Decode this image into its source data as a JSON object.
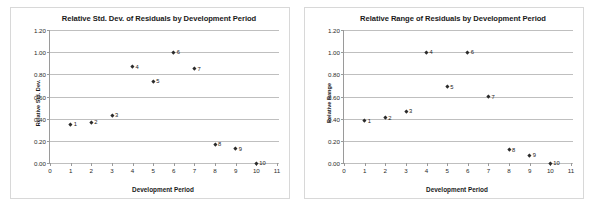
{
  "chart_data": [
    {
      "type": "scatter",
      "title": "Relative Std. Dev. of Residuals by Development Period",
      "xlabel": "Development Period",
      "ylabel": "Relative Std. Dev.",
      "xlim": [
        0,
        11
      ],
      "ylim": [
        0.0,
        1.2
      ],
      "xticks": [
        "0",
        "1",
        "2",
        "3",
        "4",
        "5",
        "6",
        "7",
        "8",
        "9",
        "10",
        "11"
      ],
      "yticks": [
        "0.00",
        "0.20",
        "0.40",
        "0.60",
        "0.80",
        "1.00",
        "1.20"
      ],
      "grid": "horizontal",
      "legend": "none",
      "x": [
        1,
        2,
        3,
        4,
        5,
        6,
        7,
        8,
        9,
        10
      ],
      "values": [
        0.35,
        0.37,
        0.43,
        0.87,
        0.74,
        1.0,
        0.85,
        0.17,
        0.13,
        0.0
      ],
      "point_labels": [
        "1",
        "2",
        "3",
        "4",
        "5",
        "6",
        "7",
        "8",
        "9",
        "10"
      ]
    },
    {
      "type": "scatter",
      "title": "Relative Range of Residuals by Development Period",
      "xlabel": "Development Period",
      "ylabel": "Relative Range",
      "xlim": [
        0,
        11
      ],
      "ylim": [
        0.0,
        1.2
      ],
      "xticks": [
        "0",
        "1",
        "2",
        "3",
        "4",
        "5",
        "6",
        "7",
        "8",
        "9",
        "10",
        "11"
      ],
      "yticks": [
        "0.00",
        "0.20",
        "0.40",
        "0.60",
        "0.80",
        "1.00",
        "1.20"
      ],
      "grid": "horizontal",
      "legend": "none",
      "x": [
        1,
        2,
        3,
        4,
        5,
        6,
        7,
        8,
        9,
        10
      ],
      "values": [
        0.38,
        0.41,
        0.47,
        1.0,
        0.69,
        1.0,
        0.6,
        0.12,
        0.07,
        0.0
      ],
      "point_labels": [
        "1",
        "2",
        "3",
        "4",
        "5",
        "6",
        "7",
        "8",
        "9",
        "10"
      ]
    }
  ]
}
